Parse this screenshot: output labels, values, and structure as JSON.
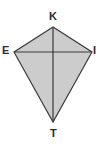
{
  "figure": {
    "kind": "geometry-diagram",
    "shape_name": "kite",
    "background_color": "#ffffff",
    "fill_color": "#cccccc",
    "stroke_color": "#3a3a3a",
    "diagonal_color": "#3a3a3a",
    "stroke_width": 1.2,
    "canvas": {
      "width": 102,
      "height": 147
    },
    "vertices": [
      {
        "id": "K",
        "label": "K",
        "x": 53,
        "y": 27,
        "role": "top-apex",
        "label_x": 49,
        "label_y": 11
      },
      {
        "id": "E",
        "label": "E",
        "x": 14,
        "y": 52,
        "role": "left",
        "label_x": 2,
        "label_y": 45
      },
      {
        "id": "I",
        "label": "I",
        "x": 92,
        "y": 52,
        "role": "right",
        "label_x": 93,
        "label_y": 45
      },
      {
        "id": "T",
        "label": "T",
        "x": 53,
        "y": 122,
        "role": "bottom-apex",
        "label_x": 50,
        "label_y": 128
      }
    ],
    "outline_path": "K,E,T,I",
    "diagonals": [
      {
        "id": "KT",
        "from": "K",
        "to": "T",
        "orientation": "vertical"
      },
      {
        "id": "EI",
        "from": "E",
        "to": "I",
        "orientation": "horizontal"
      }
    ],
    "intersection": {
      "x": 53,
      "y": 52
    }
  }
}
